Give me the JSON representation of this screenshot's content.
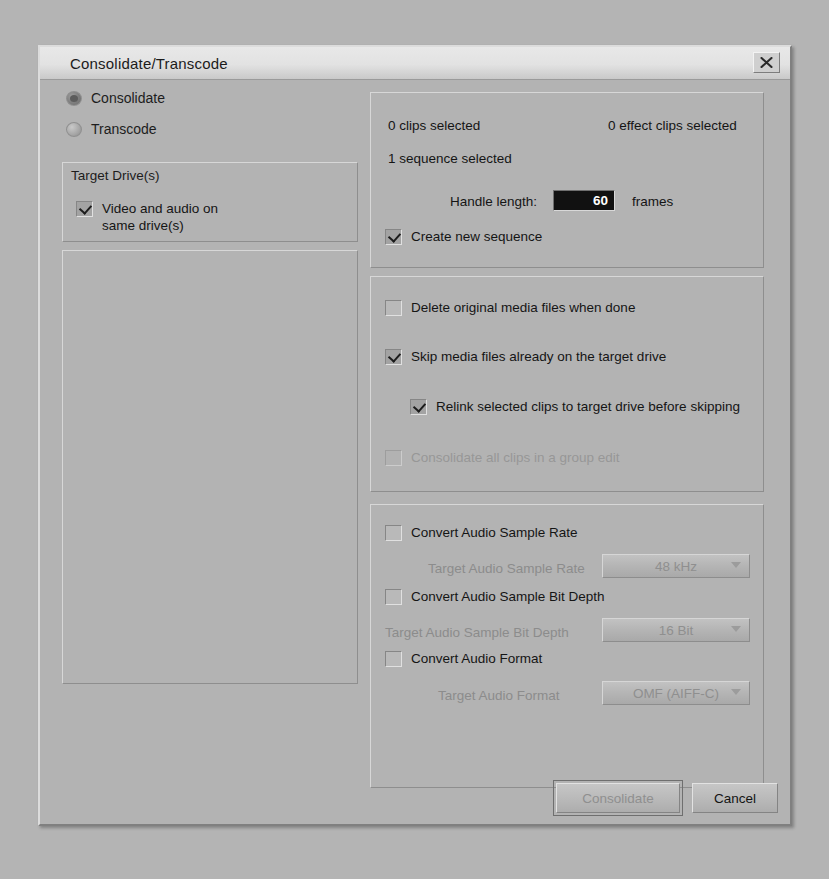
{
  "window": {
    "title": "Consolidate/Transcode",
    "close_icon": "close-icon",
    "close_glyph": "╳"
  },
  "mode": {
    "options": [
      {
        "label": "Consolidate",
        "selected": true
      },
      {
        "label": "Transcode",
        "selected": false
      }
    ]
  },
  "target_drives": {
    "group_title": "Target Drive(s)",
    "same_drive_checkbox": {
      "label_line1": "Video and audio on",
      "label_line2": "same drive(s)",
      "checked": true
    },
    "video_label": "Video",
    "drives": [
      {
        "name": "TeraUSB (E:)",
        "selected": false
      }
    ]
  },
  "selection_panel": {
    "clips_selected": "0 clips selected",
    "effect_clips_selected": "0 effect clips selected",
    "sequence_selected": "1 sequence selected",
    "handle_length_label": "Handle length:",
    "handle_length_value": "60",
    "frames_label": "frames",
    "create_new_sequence": {
      "label": "Create new sequence",
      "checked": true
    }
  },
  "options_panel": {
    "items": [
      {
        "label": "Delete original media files when done",
        "checked": false,
        "disabled": false,
        "indent": 0
      },
      {
        "label": "Skip media files already on the target drive",
        "checked": true,
        "disabled": false,
        "indent": 0
      },
      {
        "label": "Relink selected clips to target drive before skipping",
        "checked": true,
        "disabled": false,
        "indent": 1
      },
      {
        "label": "Consolidate all clips in a group edit",
        "checked": false,
        "disabled": true,
        "indent": 0
      }
    ]
  },
  "audio_panel": {
    "convert_sample_rate": {
      "label": "Convert Audio Sample Rate",
      "checked": false
    },
    "target_sample_rate": {
      "label": "Target Audio Sample Rate",
      "value": "48 kHz",
      "disabled": true
    },
    "convert_bit_depth": {
      "label": "Convert Audio Sample Bit Depth",
      "checked": false
    },
    "target_bit_depth": {
      "label": "Target Audio Sample Bit Depth",
      "value": "16 Bit",
      "disabled": true
    },
    "convert_format": {
      "label": "Convert Audio Format",
      "checked": false
    },
    "target_format": {
      "label": "Target Audio Format",
      "value": "OMF (AIFF-C)",
      "disabled": true
    }
  },
  "footer": {
    "confirm_label": "Consolidate",
    "confirm_disabled": true,
    "cancel_label": "Cancel"
  },
  "colors": {
    "dialog_background": "#b3b3b3",
    "titlebar": "#e2e2e2",
    "text": "#151515",
    "disabled_text": "#8f8f8f",
    "list_background": "#ffffff",
    "input_background": "#111111"
  }
}
